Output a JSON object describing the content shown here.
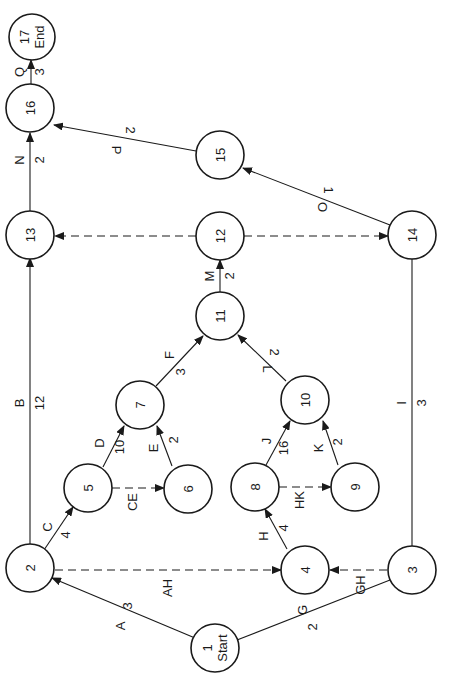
{
  "diagram": {
    "type": "activity-on-arrow network (rotated 90°)",
    "nodes": [
      {
        "id": "n1",
        "label": "1",
        "sub": "Start",
        "x": 215,
        "y": 648
      },
      {
        "id": "n2",
        "label": "2",
        "x": 30,
        "y": 568
      },
      {
        "id": "n3",
        "label": "3",
        "x": 412,
        "y": 570
      },
      {
        "id": "n4",
        "label": "4",
        "x": 305,
        "y": 570
      },
      {
        "id": "n5",
        "label": "5",
        "x": 88,
        "y": 488
      },
      {
        "id": "n6",
        "label": "6",
        "x": 188,
        "y": 489
      },
      {
        "id": "n7",
        "label": "7",
        "x": 140,
        "y": 405
      },
      {
        "id": "n8",
        "label": "8",
        "x": 255,
        "y": 487
      },
      {
        "id": "n9",
        "label": "9",
        "x": 355,
        "y": 487
      },
      {
        "id": "n10",
        "label": "10",
        "x": 305,
        "y": 400
      },
      {
        "id": "n11",
        "label": "11",
        "x": 220,
        "y": 316
      },
      {
        "id": "n12",
        "label": "12",
        "x": 220,
        "y": 236
      },
      {
        "id": "n13",
        "label": "13",
        "x": 30,
        "y": 235
      },
      {
        "id": "n14",
        "label": "14",
        "x": 412,
        "y": 235
      },
      {
        "id": "n15",
        "label": "15",
        "x": 220,
        "y": 155
      },
      {
        "id": "n16",
        "label": "16",
        "x": 30,
        "y": 108
      },
      {
        "id": "n17",
        "label": "17",
        "sub": "End",
        "x": 32,
        "y": 37
      }
    ],
    "activities": [
      {
        "name": "A",
        "duration": "3",
        "from": "1",
        "to": "2",
        "dummy": false
      },
      {
        "name": "G",
        "duration": "2",
        "from": "1",
        "to": "3",
        "dummy": false
      },
      {
        "name": "B",
        "duration": "12",
        "from": "2",
        "to": "13",
        "dummy": false
      },
      {
        "name": "C",
        "duration": "4",
        "from": "2",
        "to": "5",
        "dummy": false
      },
      {
        "name": "AH",
        "duration": "",
        "from": "2",
        "to": "4",
        "dummy": true
      },
      {
        "name": "GH",
        "duration": "",
        "from": "3",
        "to": "4",
        "dummy": true
      },
      {
        "name": "I",
        "duration": "3",
        "from": "3",
        "to": "14",
        "dummy": false
      },
      {
        "name": "H",
        "duration": "4",
        "from": "4",
        "to": "8",
        "dummy": false
      },
      {
        "name": "D",
        "duration": "10",
        "from": "5",
        "to": "7",
        "dummy": false
      },
      {
        "name": "CE",
        "duration": "",
        "from": "5",
        "to": "6",
        "dummy": true
      },
      {
        "name": "E",
        "duration": "2",
        "from": "6",
        "to": "7",
        "dummy": false
      },
      {
        "name": "F",
        "duration": "3",
        "from": "7",
        "to": "11",
        "dummy": false
      },
      {
        "name": "J",
        "duration": "16",
        "from": "8",
        "to": "10",
        "dummy": false
      },
      {
        "name": "HK",
        "duration": "",
        "from": "8",
        "to": "9",
        "dummy": true
      },
      {
        "name": "K",
        "duration": "2",
        "from": "9",
        "to": "10",
        "dummy": false
      },
      {
        "name": "L",
        "duration": "2",
        "from": "10",
        "to": "11",
        "dummy": false
      },
      {
        "name": "M",
        "duration": "2",
        "from": "11",
        "to": "12",
        "dummy": false
      },
      {
        "name": "dummy-12-13",
        "duration": "",
        "from": "12",
        "to": "13",
        "dummy": true
      },
      {
        "name": "dummy-12-14",
        "duration": "",
        "from": "12",
        "to": "14",
        "dummy": true
      },
      {
        "name": "O",
        "duration": "1",
        "from": "14",
        "to": "15",
        "dummy": false
      },
      {
        "name": "N",
        "duration": "2",
        "from": "13",
        "to": "16",
        "dummy": false
      },
      {
        "name": "P",
        "duration": "2",
        "from": "15",
        "to": "16",
        "dummy": false
      },
      {
        "name": "Q",
        "duration": "3",
        "from": "16",
        "to": "17",
        "dummy": false
      }
    ],
    "colors": {
      "line": "#1a1a1a",
      "background": "#ffffff"
    }
  },
  "labels": {
    "n1": "1",
    "n1_sub": "Start",
    "n2": "2",
    "n3": "3",
    "n4": "4",
    "n5": "5",
    "n6": "6",
    "n7": "7",
    "n8": "8",
    "n9": "9",
    "n10": "10",
    "n11": "11",
    "n12": "12",
    "n13": "13",
    "n14": "14",
    "n15": "15",
    "n16": "16",
    "n17": "17",
    "n17_sub": "End",
    "A": "A",
    "A_d": "3",
    "G": "G",
    "G_d": "2",
    "B": "B",
    "B_d": "12",
    "C": "C",
    "C_d": "4",
    "AH": "AH",
    "GH": "GH",
    "I": "I",
    "I_d": "3",
    "H": "H",
    "H_d": "4",
    "D": "D",
    "D_d": "10",
    "CE": "CE",
    "E": "E",
    "E_d": "2",
    "F": "F",
    "F_d": "3",
    "J": "J",
    "J_d": "16",
    "HK": "HK",
    "K": "K",
    "K_d": "2",
    "L": "L",
    "L_d": "2",
    "M": "M",
    "M_d": "2",
    "O": "O",
    "O_d": "1",
    "N": "N",
    "N_d": "2",
    "P": "P",
    "P_d": "2",
    "Q": "Q",
    "Q_d": "3"
  }
}
